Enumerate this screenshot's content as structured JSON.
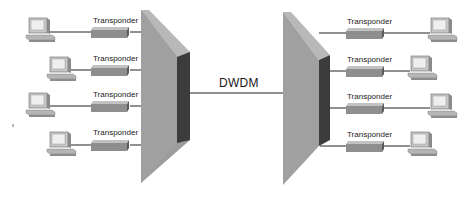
{
  "diagram": {
    "title": "DWDM",
    "link_label": "DWDM",
    "left_side": {
      "transponders": [
        {
          "label": "Transponder"
        },
        {
          "label": "Transponder"
        },
        {
          "label": "Transponder"
        },
        {
          "label": "Transponder"
        }
      ],
      "computers": 4
    },
    "right_side": {
      "transponders": [
        {
          "label": "Transponder"
        },
        {
          "label": "Transponder"
        },
        {
          "label": "Transponder"
        },
        {
          "label": "Transponder"
        }
      ],
      "computers": 4
    },
    "colors": {
      "mux_face": "#9c9c9c",
      "mux_top": "#b8b8b8",
      "mux_side": "#3c3c3c",
      "transponder": "#8e8e8e",
      "line": "#222222"
    }
  }
}
